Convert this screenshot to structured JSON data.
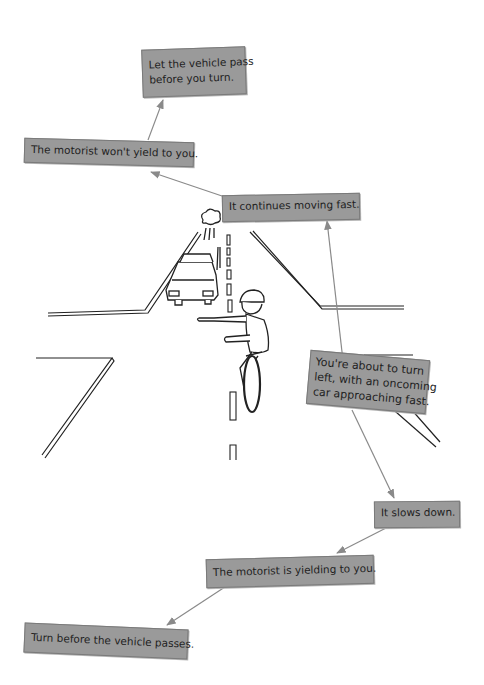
{
  "colors": {
    "box_fill": "#9a9a9a",
    "box_border": "#7a7a7a",
    "arrow": "#8a8a8a",
    "ink": "#1e1e1e"
  },
  "scenario": {
    "text": "You're about to turn left, with an oncoming car approaching fast.",
    "lines": [
      "You're about to turn",
      "left, with an oncoming",
      "car approaching fast."
    ]
  },
  "branch_fast": {
    "event": "It continues moving fast.",
    "interpretation": "The motorist won't yield to you.",
    "action_lines": [
      "Let the vehicle pass",
      "before you turn."
    ]
  },
  "branch_slow": {
    "event": "It slows down.",
    "interpretation": "The motorist is yielding to you.",
    "action": "Turn before the vehicle passes."
  },
  "illustration": {
    "subjects": [
      "oncoming-car",
      "cyclist-left-turn-signal",
      "intersection",
      "center-lane-dashes"
    ]
  }
}
